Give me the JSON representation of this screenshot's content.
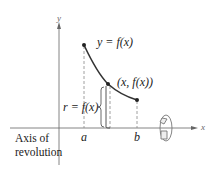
{
  "diagram": {
    "axes": {
      "x_label": "x",
      "y_label": "y"
    },
    "curve": {
      "label": "y = f(x)",
      "color": "#333333",
      "points": [
        {
          "name": "start",
          "at": "a"
        },
        {
          "name": "middle",
          "label": "(x, f(x))"
        },
        {
          "name": "end",
          "at": "b"
        }
      ]
    },
    "radius_label": "r = f(x)",
    "ticks": [
      "a",
      "b"
    ],
    "axis_of_revolution_label_line1": "Axis of",
    "axis_of_revolution_label_line2": "revolution",
    "icons": [
      "rotation-arrow-icon"
    ]
  }
}
